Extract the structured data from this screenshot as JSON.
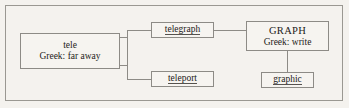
{
  "diagram": {
    "type": "word-root-tree",
    "title": "",
    "nodes": [
      {
        "id": "tele",
        "line1": "tele",
        "line2": "Greek: far away",
        "underlined": false
      },
      {
        "id": "telegraph",
        "line1": "telegraph",
        "line2": "",
        "underlined": true
      },
      {
        "id": "teleport",
        "line1": "teleport",
        "line2": "",
        "underlined": true
      },
      {
        "id": "graph",
        "line1": "GRAPH",
        "line2": "Greek:  write",
        "underlined": false
      },
      {
        "id": "graphic",
        "line1": "graphic",
        "line2": "",
        "underlined": true
      }
    ],
    "connections": [
      {
        "from": "tele",
        "to": "telegraph"
      },
      {
        "from": "tele",
        "to": "teleport"
      },
      {
        "from": "telegraph",
        "to": "graph"
      },
      {
        "from": "graph",
        "to": "graphic"
      }
    ]
  },
  "style": {
    "page_background": "#f4f2ee",
    "border_color": "#8d8b86",
    "frame_color": "#9a9892",
    "text_color": "#1d1b19"
  }
}
